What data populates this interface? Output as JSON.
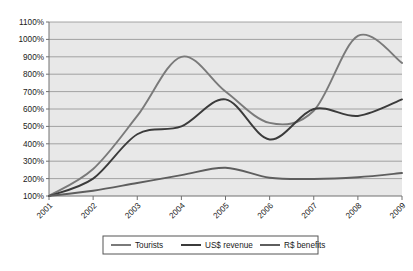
{
  "chart_data": {
    "type": "line",
    "title": "",
    "xlabel": "",
    "ylabel": "",
    "categories": [
      "2001",
      "2002",
      "2003",
      "2004",
      "2005",
      "2006",
      "2007",
      "2008",
      "2009"
    ],
    "ylim": [
      100,
      1100
    ],
    "ytick_step": 100,
    "ytick_labels": [
      "100%",
      "200%",
      "300%",
      "400%",
      "500%",
      "600%",
      "700%",
      "800%",
      "900%",
      "1000%",
      "1100%"
    ],
    "ytick_values": [
      100,
      200,
      300,
      400,
      500,
      600,
      700,
      800,
      900,
      1000,
      1100
    ],
    "grid": "horizontal",
    "legend_position": "bottom",
    "smoothed_lines": true,
    "plot_background": "#e8e8e8",
    "series": [
      {
        "name": "Tourists",
        "color": "#7a7a7a",
        "values": [
          100,
          255,
          560,
          900,
          700,
          520,
          590,
          1020,
          865
        ]
      },
      {
        "name": "US$ revenue",
        "color": "#3b3b3b",
        "values": [
          100,
          200,
          455,
          500,
          655,
          425,
          600,
          560,
          655
        ]
      },
      {
        "name": "R$ benefits",
        "color": "#5e5e5e",
        "values": [
          100,
          130,
          175,
          220,
          262,
          205,
          198,
          208,
          232
        ]
      }
    ]
  },
  "legend": {
    "items": [
      {
        "label": "Tourists",
        "color": "#7a7a7a"
      },
      {
        "label": "US$ revenue",
        "color": "#3b3b3b"
      },
      {
        "label": "R$ benefits",
        "color": "#5e5e5e"
      }
    ]
  },
  "colors": {
    "plot_area": "#e8e8e8",
    "gridline": "#8f8f8f",
    "axis": "#707070",
    "text": "#1a1a1a",
    "legend_border": "#555555",
    "page_background": "#ffffff"
  }
}
